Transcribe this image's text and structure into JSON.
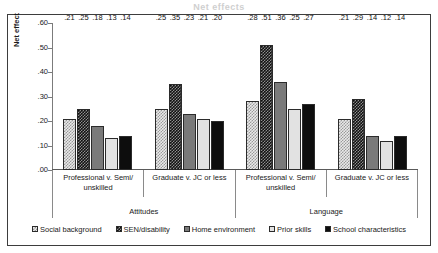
{
  "figure": {
    "cut_off_title": "Net effects"
  },
  "chart_data": {
    "type": "bar",
    "title": "",
    "xlabel": "",
    "ylabel": "Net effect",
    "ylim": [
      0.0,
      0.6
    ],
    "ytick_labels": [
      ".60",
      ".50",
      ".40",
      ".30",
      ".20",
      ".10",
      ".00"
    ],
    "ytick_values": [
      0.6,
      0.5,
      0.4,
      0.3,
      0.2,
      0.1,
      0.0
    ],
    "grid": false,
    "legend_position": "bottom",
    "super_groups": [
      {
        "label": "Attitudes",
        "span": 2
      },
      {
        "label": "Language",
        "span": 2
      }
    ],
    "categories": [
      "Professional v. Semi/ unskilled",
      "Graduate v. JC or less",
      "Professional v. Semi/ unskilled",
      "Graduate v. JC or less"
    ],
    "series": [
      {
        "name": "Social background",
        "values": [
          0.21,
          0.25,
          0.28,
          0.21
        ],
        "labels": [
          ".21",
          ".25",
          ".28",
          ".21"
        ]
      },
      {
        "name": "SEN/disability",
        "values": [
          0.25,
          0.35,
          0.51,
          0.29
        ],
        "labels": [
          ".25",
          ".35",
          ".51",
          ".29"
        ]
      },
      {
        "name": "Home environment",
        "values": [
          0.18,
          0.23,
          0.36,
          0.14
        ],
        "labels": [
          ".18",
          ".23",
          ".36",
          ".14"
        ]
      },
      {
        "name": "Prior skills",
        "values": [
          0.13,
          0.21,
          0.25,
          0.12
        ],
        "labels": [
          ".13",
          ".21",
          ".25",
          ".12"
        ]
      },
      {
        "name": "School characteristics",
        "values": [
          0.14,
          0.2,
          0.27,
          0.14
        ],
        "labels": [
          ".14",
          ".20",
          ".27",
          ".14"
        ]
      }
    ],
    "colors": {
      "series_1_fill": "#e9e9e9",
      "series_2_fill": "#111111",
      "series_3_fill": "#7a7a7a",
      "series_4_fill": "#e2e2e2",
      "series_5_fill": "#0d0d0d",
      "axis": "#7b7b7b",
      "border": "#3d3d3d",
      "background": "#ffffff"
    }
  }
}
